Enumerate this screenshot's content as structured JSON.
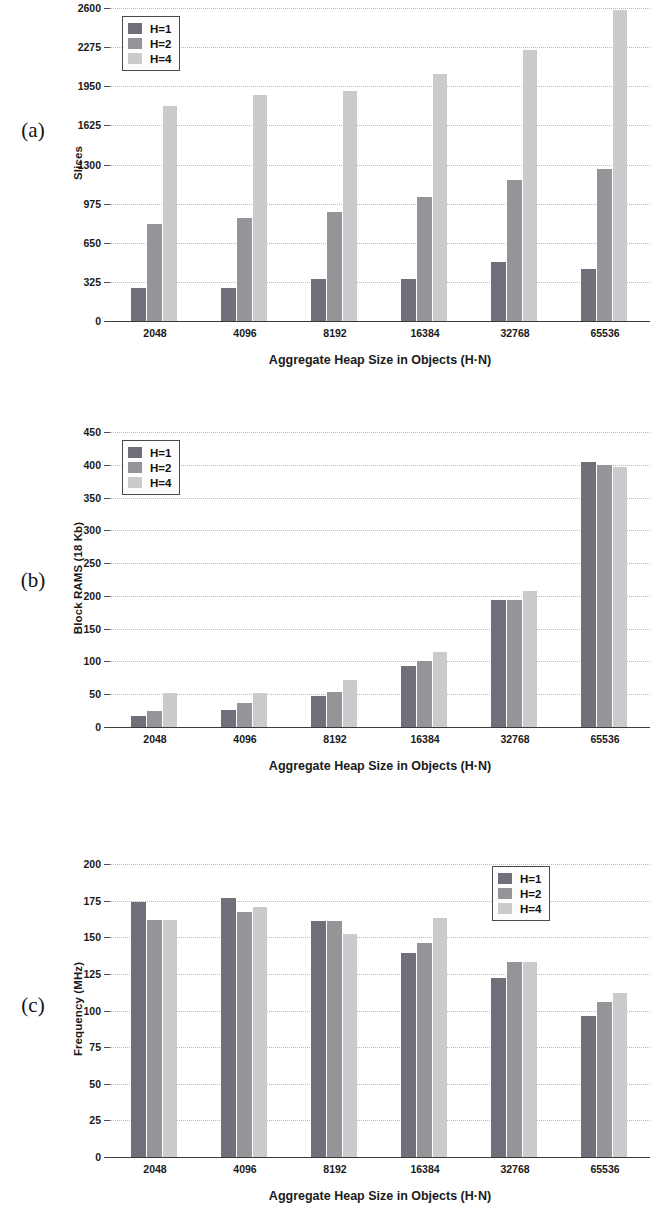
{
  "figure": {
    "panels": [
      {
        "letter": "(a)",
        "xlabel": "Aggregate Heap Size in Objects (H·N)",
        "ylabel": "Slices",
        "legend_position": "top-left",
        "chart_data": {
          "type": "bar",
          "title": "",
          "xlabel": "Aggregate Heap Size in Objects (H·N)",
          "ylabel": "Slices",
          "categories": [
            "2048",
            "4096",
            "8192",
            "16384",
            "32768",
            "65536"
          ],
          "yticks": [
            0,
            325,
            650,
            975,
            1300,
            1625,
            1950,
            2275,
            2600
          ],
          "ylim": [
            0,
            2600
          ],
          "grid": true,
          "series": [
            {
              "name": "H=1",
              "color": "#70707a",
              "values": [
                272,
                272,
                345,
                350,
                488,
                430
              ]
            },
            {
              "name": "H=2",
              "color": "#959599",
              "values": [
                805,
                855,
                905,
                1030,
                1170,
                1265
              ]
            },
            {
              "name": "H=4",
              "color": "#cbcbcd",
              "values": [
                1790,
                1875,
                1910,
                2055,
                2255,
                2580
              ]
            }
          ]
        }
      },
      {
        "letter": "(b)",
        "xlabel": "Aggregate Heap Size in Objects (H·N)",
        "ylabel": "Block RAMS (18 Kb)",
        "legend_position": "top-left",
        "chart_data": {
          "type": "bar",
          "title": "",
          "xlabel": "Aggregate Heap Size in Objects (H·N)",
          "ylabel": "Block RAMS (18 Kb)",
          "categories": [
            "2048",
            "4096",
            "8192",
            "16384",
            "32768",
            "65536"
          ],
          "yticks": [
            0,
            50,
            100,
            150,
            200,
            250,
            300,
            350,
            400,
            450
          ],
          "ylim": [
            0,
            450
          ],
          "grid": true,
          "series": [
            {
              "name": "H=1",
              "color": "#70707a",
              "values": [
                17,
                26,
                48,
                93,
                194,
                404
              ]
            },
            {
              "name": "H=2",
              "color": "#959599",
              "values": [
                25,
                36,
                53,
                100,
                194,
                400
              ]
            },
            {
              "name": "H=4",
              "color": "#cbcbcd",
              "values": [
                52,
                52,
                72,
                115,
                207,
                396
              ]
            }
          ]
        }
      },
      {
        "letter": "(c)",
        "xlabel": "Aggregate Heap Size in Objects (H·N)",
        "ylabel": "Frequency (MHz)",
        "legend_position": "top-right",
        "chart_data": {
          "type": "bar",
          "title": "",
          "xlabel": "Aggregate Heap Size in Objects (H·N)",
          "ylabel": "Frequency (MHz)",
          "categories": [
            "2048",
            "4096",
            "8192",
            "16384",
            "32768",
            "65536"
          ],
          "yticks": [
            0,
            25,
            50,
            75,
            100,
            125,
            150,
            175,
            200
          ],
          "ylim": [
            0,
            200
          ],
          "grid": true,
          "series": [
            {
              "name": "H=1",
              "color": "#70707a",
              "values": [
                174,
                177,
                161,
                139,
                122,
                96
              ]
            },
            {
              "name": "H=2",
              "color": "#959599",
              "values": [
                162,
                167,
                161,
                146,
                133,
                106
              ]
            },
            {
              "name": "H=4",
              "color": "#cbcbcd",
              "values": [
                162,
                171,
                152,
                163,
                133,
                112
              ]
            }
          ]
        }
      }
    ]
  }
}
